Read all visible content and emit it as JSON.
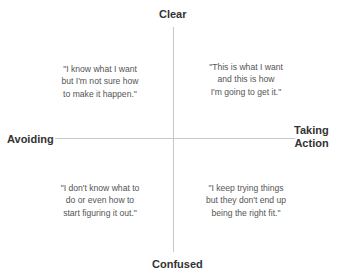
{
  "axes": {
    "top": "Clear",
    "bottom": "Confused",
    "left": "Avoiding",
    "right": "Taking\nAction"
  },
  "quadrants": {
    "top_left": "\"I know what I want\nbut I'm not sure how\nto make it happen.\"",
    "top_right": "\"This is what I want\nand this is how\nI'm going to get it.\"",
    "bottom_left": "\"I don't know what to\ndo or even how to\nstart figuring it out.\"",
    "bottom_right": "\"I keep trying things\nbut they don't end up\nbeing the right fit.\""
  }
}
